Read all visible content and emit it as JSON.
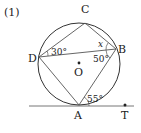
{
  "problem_label": "(1)",
  "points": {
    "A": {
      "label": "A",
      "x": 79,
      "y": 105
    },
    "B": {
      "label": "B",
      "x": 116,
      "y": 49
    },
    "C": {
      "label": "C",
      "x": 85,
      "y": 23
    },
    "D": {
      "label": "D",
      "x": 39,
      "y": 57
    },
    "O": {
      "label": "O",
      "x": 79,
      "y": 64
    },
    "T": {
      "label": "T",
      "x": 125,
      "y": 105
    }
  },
  "circle": {
    "cx": 79,
    "cy": 64,
    "r": 41
  },
  "angles": {
    "CDB": "30°",
    "CBD": "x",
    "DBA": "50°",
    "BAT": "55°"
  },
  "colors": {
    "line": "#555555",
    "circle": "#333333",
    "text": "#222222"
  }
}
